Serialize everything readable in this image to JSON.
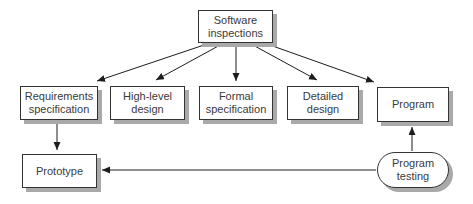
{
  "nodes": {
    "software_inspections": {
      "label": "Software\ninspections"
    },
    "requirements_specification": {
      "label": "Requirements\nspecification"
    },
    "high_level_design": {
      "label": "High-level\ndesign"
    },
    "formal_specification": {
      "label": "Formal\nspecification"
    },
    "detailed_design": {
      "label": "Detailed\ndesign"
    },
    "program": {
      "label": "Program"
    },
    "prototype": {
      "label": "Prototype"
    },
    "program_testing": {
      "label": "Program\ntesting"
    }
  },
  "edges": [
    {
      "from": "software_inspections",
      "to": "requirements_specification"
    },
    {
      "from": "software_inspections",
      "to": "high_level_design"
    },
    {
      "from": "software_inspections",
      "to": "formal_specification"
    },
    {
      "from": "software_inspections",
      "to": "detailed_design"
    },
    {
      "from": "software_inspections",
      "to": "program"
    },
    {
      "from": "requirements_specification",
      "to": "prototype"
    },
    {
      "from": "program_testing",
      "to": "prototype"
    },
    {
      "from": "program_testing",
      "to": "program"
    }
  ],
  "colors": {
    "background": "#ffffff",
    "node_fill": "#ffffff",
    "node_border": "#333333",
    "node_shadow": "#a9a9a9",
    "arrow": "#1c1c1c",
    "text": "#3a3a3a"
  }
}
